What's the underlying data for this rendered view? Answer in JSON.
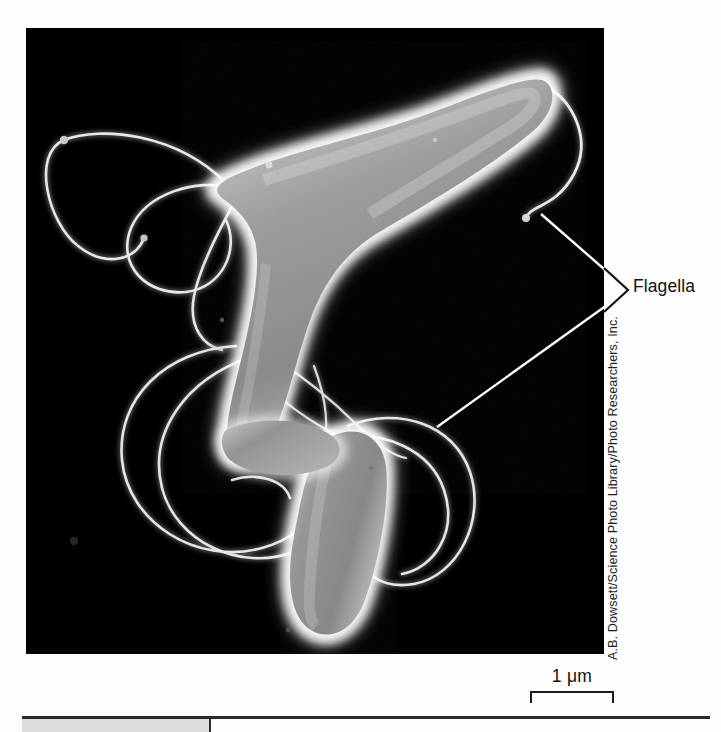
{
  "figure": {
    "kind": "scanning-electron-micrograph",
    "background_color": "#fdfdfd",
    "plate_color": "#000000"
  },
  "annotations": {
    "flagella_label": "Flagella",
    "leader_vertex": {
      "x": 628,
      "y": 290
    },
    "leader_endpoints": [
      {
        "name": "upper-flagellum-tip",
        "x": 541,
        "y": 214
      },
      {
        "name": "lower-flagellum-loop",
        "x": 437,
        "y": 427
      }
    ],
    "line_color": "#ffffff"
  },
  "credit": {
    "text": "A.B. Dowsett/Science Photo Library/Photo Researchers, Inc.",
    "orientation": "vertical-bottom-to-top"
  },
  "scale_bar": {
    "label": "1 μm",
    "value": 1,
    "unit": "μm",
    "bracket_width_px": 84
  },
  "footer": {
    "rule_color": "#2a2a2a",
    "tab_color": "#dcdcdc"
  }
}
